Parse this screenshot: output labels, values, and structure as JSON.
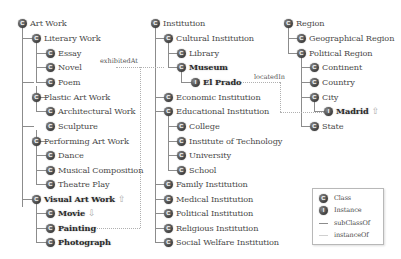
{
  "trees": {
    "art_work": {
      "root": "Art Work",
      "literary_work": "Literary Work",
      "essay": "Essay",
      "novel": "Novel",
      "poem": "Poem",
      "plastic_art_work": "Plastic Art Work",
      "architectural_work": "Architectural Work",
      "sculpture": "Sculpture",
      "performing_art_work": "Performing Art Work",
      "dance": "Dance",
      "musical_composition": "Musical Composition",
      "theatre_play": "Theatre Play",
      "visual_art_work": "Visual Art Work",
      "movie": "Movie",
      "painting": "Painting",
      "photograph": "Photograph"
    },
    "institution": {
      "root": "Institution",
      "cultural_institution": "Cultural Institution",
      "library": "Library",
      "museum": "Museum",
      "el_prado": "El Prado",
      "economic_institution": "Economic Institution",
      "educational_institution": "Educational Institution",
      "college": "College",
      "institute_of_technology": "Institute of  Technology",
      "university": "University",
      "school": "School",
      "family_institution": "Family Institution",
      "medical_institution": "Medical Institution",
      "political_institution": "Political Institution",
      "religious_institution": "Religious Institution",
      "social_welfare_institution": "Social Welfare Institution"
    },
    "region": {
      "root": "Region",
      "geographical_region": "Geographical Region",
      "political_region": "Political Region",
      "continent": "Continent",
      "country": "Country",
      "city": "City",
      "madrid": "Madrid",
      "state": "State"
    }
  },
  "relations": {
    "exhibited_at": "exhibitedAt",
    "located_in": "locatedIn"
  },
  "icons": {
    "class_glyph": "C",
    "instance_glyph": "I",
    "up_arrow": "⇧",
    "down_arrow": "⇩"
  },
  "legend": {
    "class": "Class",
    "instance": "Instance",
    "subclass_of": "subClassOf",
    "instance_of": "instanceOf"
  },
  "colors": {
    "node_icon": "#4a4a4a",
    "tree_line": "#8c8c8c",
    "relation_line": "#b0b0b0",
    "arrow": "#aaaaaa"
  }
}
